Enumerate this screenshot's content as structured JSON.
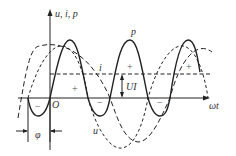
{
  "axes": {
    "y_label": "u, i, p",
    "x_label": "ωt",
    "origin_label": "O"
  },
  "curves": {
    "p_label": "p",
    "i_label": "i",
    "u_label": "u"
  },
  "annotations": {
    "average_power_label": "UI",
    "phase_label": "φ",
    "positive_signs": [
      "+",
      "+",
      "+",
      "+"
    ],
    "negative_signs": [
      "−",
      "−",
      "−"
    ]
  },
  "colors": {
    "line": "#222222",
    "background": "#ffffff"
  }
}
